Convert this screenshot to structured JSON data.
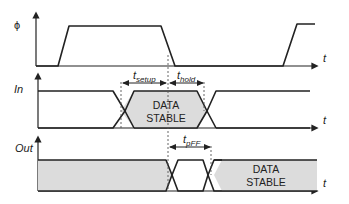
{
  "signals": {
    "phi": {
      "label": "ϕ",
      "axis_label": "t"
    },
    "in": {
      "label": "In",
      "axis_label": "t",
      "region_label_line1": "DATA",
      "region_label_line2": "STABLE"
    },
    "out": {
      "label": "Out",
      "axis_label": "t",
      "region_label_line1": "DATA",
      "region_label_line2": "STABLE"
    }
  },
  "annotations": {
    "t_setup": {
      "base": "t",
      "sub": "setup"
    },
    "t_hold": {
      "base": "t",
      "sub": "hold"
    },
    "t_pFF": {
      "base": "t",
      "sub": "pFF"
    }
  },
  "colors": {
    "line": "#222222",
    "stable_fill": "#dcdcdc",
    "background": "#ffffff"
  }
}
